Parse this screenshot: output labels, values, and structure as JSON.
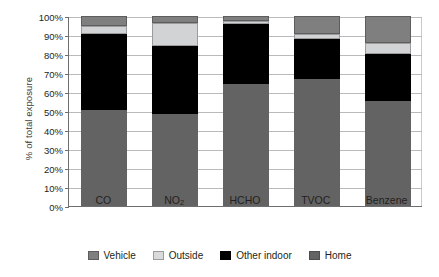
{
  "chart_data": {
    "type": "bar",
    "subtype": "stacked-bar-100-percent",
    "title": "",
    "xlabel": "",
    "ylabel": "% of total exposure",
    "ylim": [
      0,
      100
    ],
    "yunit": "%",
    "ytick_labels": [
      "0%",
      "10%",
      "20%",
      "30%",
      "40%",
      "50%",
      "60%",
      "70%",
      "80%",
      "90%",
      "100%"
    ],
    "ytick_values": [
      0,
      10,
      20,
      30,
      40,
      50,
      60,
      70,
      80,
      90,
      100
    ],
    "grid": true,
    "grid_axis": "y",
    "legend_position": "bottom",
    "stack_order_bottom_to_top": [
      "Home",
      "Other indoor",
      "Outside",
      "Vehicle"
    ],
    "categories": [
      "CO",
      "NO2",
      "HCHO",
      "TVOC",
      "Benzene"
    ],
    "category_labels_html": [
      "CO",
      "NO<sub>2</sub>",
      "HCHO",
      "TVOC",
      "Benzene"
    ],
    "series": [
      {
        "name": "Vehicle",
        "color": "#7f7f7f",
        "values": [
          5.0,
          3.5,
          2.5,
          9.5,
          14.0
        ]
      },
      {
        "name": "Outside",
        "color": "#d2d3d4",
        "values": [
          4.5,
          12.5,
          1.5,
          2.5,
          6.0
        ]
      },
      {
        "name": "Other indoor",
        "color": "#000000",
        "values": [
          40.0,
          35.5,
          32.0,
          21.0,
          24.5
        ]
      },
      {
        "name": "Home",
        "color": "#636363",
        "values": [
          50.5,
          48.5,
          64.0,
          67.0,
          55.5
        ]
      }
    ],
    "cumulative_tops": {
      "CO": {
        "home": 50.5,
        "other_indoor": 90.5,
        "outside": 95.0,
        "vehicle": 100.0
      },
      "NO2": {
        "home": 48.5,
        "other_indoor": 84.0,
        "outside": 96.5,
        "vehicle": 100.0
      },
      "HCHO": {
        "home": 64.0,
        "other_indoor": 96.0,
        "outside": 97.5,
        "vehicle": 100.0
      },
      "TVOC": {
        "home": 67.0,
        "other_indoor": 88.0,
        "outside": 90.5,
        "vehicle": 100.0
      },
      "Benzene": {
        "home": 55.5,
        "other_indoor": 80.0,
        "outside": 86.0,
        "vehicle": 100.0
      }
    }
  },
  "legend": {
    "items": [
      {
        "label": "Vehicle"
      },
      {
        "label": "Outside"
      },
      {
        "label": "Other indoor"
      },
      {
        "label": "Home"
      }
    ]
  },
  "axis": {
    "y_title": "% of total exposure"
  }
}
